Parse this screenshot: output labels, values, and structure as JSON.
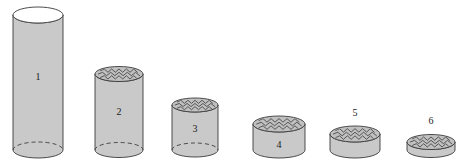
{
  "figure": {
    "background_color": "#ffffff",
    "baseline_y": 150,
    "style": {
      "body_fill": "#c9c9c9",
      "top_fill_plain": "#ffffff",
      "top_fill_liquid": "#c0c0c0",
      "stroke": "#3a3a3a",
      "stroke_width": 0.9,
      "dashed_stroke": "#3a3a3a",
      "label_color": "#1a1a1a",
      "label_font_size": 10
    },
    "cylinders": [
      {
        "label": "1",
        "center_x": 38,
        "radius_x": 25,
        "radius_y": 8,
        "top_y": 15,
        "bottom_y": 150,
        "top_type": "plain",
        "bottom_dashed": true,
        "label_position": "inside",
        "label_x": 38,
        "label_y": 78
      },
      {
        "label": "2",
        "center_x": 119,
        "radius_x": 24,
        "radius_y": 7.5,
        "top_y": 74,
        "bottom_y": 150,
        "top_type": "liquid",
        "bottom_dashed": true,
        "label_position": "inside",
        "label_x": 119,
        "label_y": 113
      },
      {
        "label": "3",
        "center_x": 195,
        "radius_x": 23,
        "radius_y": 7,
        "top_y": 105,
        "bottom_y": 150,
        "top_type": "liquid",
        "bottom_dashed": true,
        "label_position": "inside",
        "label_x": 195,
        "label_y": 130
      },
      {
        "label": "4",
        "center_x": 279,
        "radius_x": 26,
        "radius_y": 8,
        "top_y": 124,
        "bottom_y": 150,
        "top_type": "liquid",
        "bottom_dashed": false,
        "label_position": "inside",
        "label_x": 279,
        "label_y": 146
      },
      {
        "label": "5",
        "center_x": 355,
        "radius_x": 25,
        "radius_y": 8,
        "top_y": 134,
        "bottom_y": 150,
        "top_type": "liquid",
        "bottom_dashed": false,
        "label_position": "above",
        "label_x": 355,
        "label_y": 114
      },
      {
        "label": "6",
        "center_x": 431,
        "radius_x": 24,
        "radius_y": 7.5,
        "top_y": 142,
        "bottom_y": 150,
        "top_type": "liquid",
        "bottom_dashed": false,
        "label_position": "above",
        "label_x": 431,
        "label_y": 122
      }
    ]
  }
}
